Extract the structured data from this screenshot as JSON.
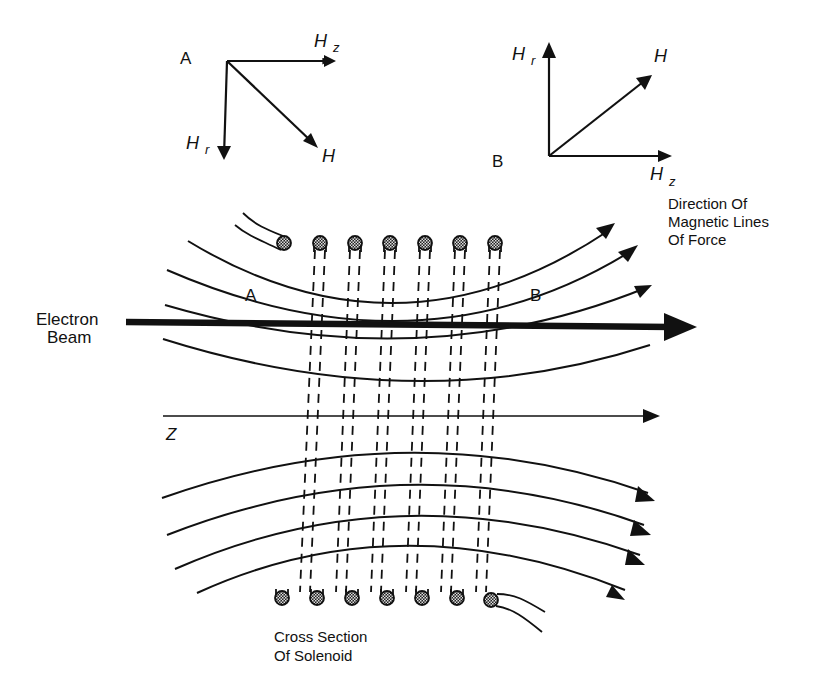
{
  "diagram": {
    "vector_diagram_a": {
      "label": "A",
      "hz_label": "H",
      "hz_sub": "z",
      "hr_label": "H",
      "hr_sub": "r",
      "h_label": "H"
    },
    "vector_diagram_b": {
      "label": "B",
      "hz_label": "H",
      "hz_sub": "z",
      "hr_label": "H",
      "hr_sub": "r",
      "h_label": "H"
    },
    "labels": {
      "direction_line1": "Direction  Of",
      "direction_line2": "Magnetic Lines",
      "direction_line3": "Of  Force",
      "electron_line1": "Electron",
      "electron_line2": "Beam",
      "point_a": "A",
      "point_b": "B",
      "axis_z": "Z",
      "cross_line1": "Cross Section",
      "cross_line2": "Of Solenoid"
    },
    "solenoid": {
      "turns": 6,
      "color": "#111111"
    },
    "colors": {
      "ink": "#111111",
      "background": "#ffffff"
    }
  }
}
